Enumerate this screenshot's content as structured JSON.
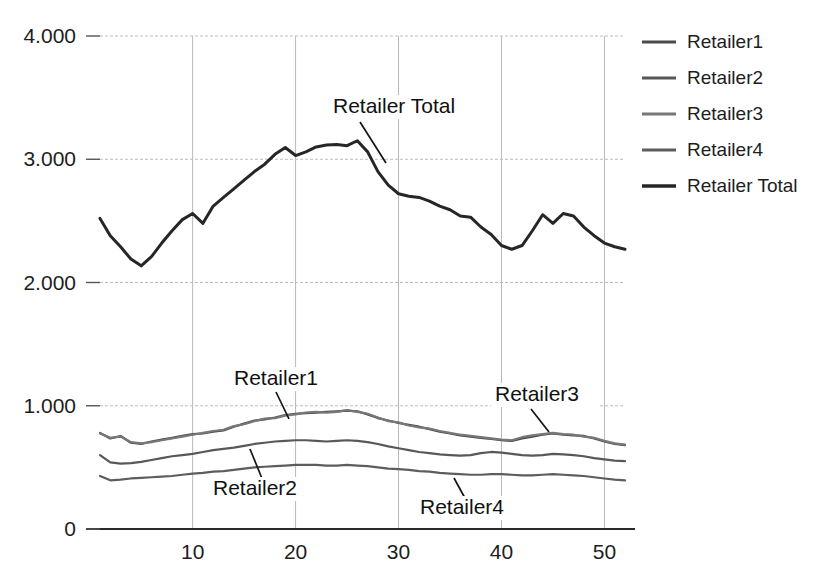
{
  "chart_data": {
    "type": "line",
    "title": "",
    "xlabel": "",
    "ylabel": "",
    "xlim": [
      1,
      52
    ],
    "ylim": [
      0,
      4000
    ],
    "grid": true,
    "legend_position": "right",
    "y_ticks": [
      0,
      1000,
      2000,
      3000,
      4000
    ],
    "y_tick_labels": [
      "0",
      "1.000",
      "2.000",
      "3.000",
      "4.000"
    ],
    "x_ticks": [
      10,
      20,
      30,
      40,
      50
    ],
    "x_tick_labels": [
      "10",
      "20",
      "30",
      "40",
      "50"
    ],
    "x": [
      1,
      2,
      3,
      4,
      5,
      6,
      7,
      8,
      9,
      10,
      11,
      12,
      13,
      14,
      15,
      16,
      17,
      18,
      19,
      20,
      21,
      22,
      23,
      24,
      25,
      26,
      27,
      28,
      29,
      30,
      31,
      32,
      33,
      34,
      35,
      36,
      37,
      38,
      39,
      40,
      41,
      42,
      43,
      44,
      45,
      46,
      47,
      48,
      49,
      50,
      51,
      52
    ],
    "series": [
      {
        "name": "Retailer1",
        "color": "#4a4a4a",
        "values": [
          780,
          735,
          755,
          700,
          690,
          710,
          725,
          740,
          755,
          770,
          775,
          790,
          800,
          830,
          855,
          880,
          890,
          905,
          925,
          935,
          940,
          945,
          950,
          955,
          960,
          955,
          930,
          900,
          880,
          860,
          845,
          830,
          810,
          790,
          775,
          760,
          750,
          740,
          730,
          720,
          715,
          735,
          750,
          765,
          775,
          765,
          760,
          755,
          735,
          710,
          690,
          680
        ]
      },
      {
        "name": "Retailer2",
        "color": "#585858",
        "values": [
          600,
          540,
          530,
          535,
          545,
          560,
          575,
          590,
          600,
          610,
          625,
          640,
          650,
          660,
          675,
          690,
          700,
          710,
          715,
          720,
          720,
          715,
          710,
          715,
          720,
          715,
          705,
          690,
          670,
          655,
          640,
          625,
          615,
          605,
          600,
          595,
          600,
          615,
          625,
          620,
          610,
          600,
          595,
          600,
          610,
          605,
          600,
          590,
          575,
          565,
          555,
          550
        ]
      },
      {
        "name": "Retailer3",
        "color": "#777777",
        "values": [
          775,
          740,
          750,
          705,
          695,
          705,
          720,
          735,
          750,
          765,
          780,
          795,
          805,
          835,
          850,
          875,
          895,
          900,
          920,
          930,
          945,
          950,
          945,
          950,
          965,
          950,
          935,
          905,
          875,
          865,
          840,
          825,
          815,
          795,
          780,
          765,
          755,
          745,
          735,
          725,
          720,
          745,
          760,
          770,
          780,
          770,
          765,
          750,
          740,
          715,
          695,
          685
        ]
      },
      {
        "name": "Retailer4",
        "color": "#5d5d5d",
        "values": [
          430,
          395,
          400,
          410,
          415,
          420,
          425,
          430,
          440,
          450,
          455,
          465,
          470,
          480,
          490,
          500,
          505,
          510,
          515,
          520,
          520,
          520,
          515,
          515,
          520,
          515,
          510,
          500,
          490,
          485,
          480,
          470,
          465,
          455,
          450,
          445,
          440,
          440,
          445,
          445,
          440,
          435,
          435,
          440,
          445,
          440,
          435,
          430,
          420,
          410,
          400,
          395
        ]
      },
      {
        "name": "Retailer Total",
        "color": "#262626",
        "values": [
          2520,
          2380,
          2290,
          2190,
          2135,
          2210,
          2320,
          2420,
          2510,
          2560,
          2480,
          2620,
          2690,
          2760,
          2830,
          2900,
          2960,
          3040,
          3095,
          3030,
          3060,
          3100,
          3115,
          3120,
          3110,
          3150,
          3060,
          2900,
          2790,
          2720,
          2700,
          2690,
          2660,
          2620,
          2590,
          2540,
          2530,
          2450,
          2390,
          2300,
          2270,
          2300,
          2420,
          2550,
          2480,
          2560,
          2540,
          2450,
          2380,
          2320,
          2290,
          2270
        ]
      }
    ],
    "annotations": [
      {
        "text": "Retailer Total",
        "label_x": 333,
        "label_y": 113,
        "leader": [
          [
            360,
            122
          ],
          [
            386,
            163
          ]
        ]
      },
      {
        "text": "Retailer1",
        "label_x": 234,
        "label_y": 385,
        "leader": [
          [
            276,
            392
          ],
          [
            289,
            419
          ]
        ]
      },
      {
        "text": "Retailer2",
        "label_x": 213,
        "label_y": 495,
        "leader": [
          [
            263,
            481
          ],
          [
            250,
            449
          ]
        ]
      },
      {
        "text": "Retailer3",
        "label_x": 495,
        "label_y": 401,
        "leader": [
          [
            531,
            409
          ],
          [
            549,
            432
          ]
        ]
      },
      {
        "text": "Retailer4",
        "label_x": 420,
        "label_y": 514,
        "leader": [
          [
            466,
            500
          ],
          [
            454,
            478
          ]
        ]
      }
    ]
  },
  "legend": {
    "items": [
      {
        "label": "Retailer1",
        "color": "#4a4a4a"
      },
      {
        "label": "Retailer2",
        "color": "#585858"
      },
      {
        "label": "Retailer3",
        "color": "#777777"
      },
      {
        "label": "Retailer4",
        "color": "#5d5d5d"
      },
      {
        "label": "Retailer Total",
        "color": "#262626"
      }
    ]
  }
}
